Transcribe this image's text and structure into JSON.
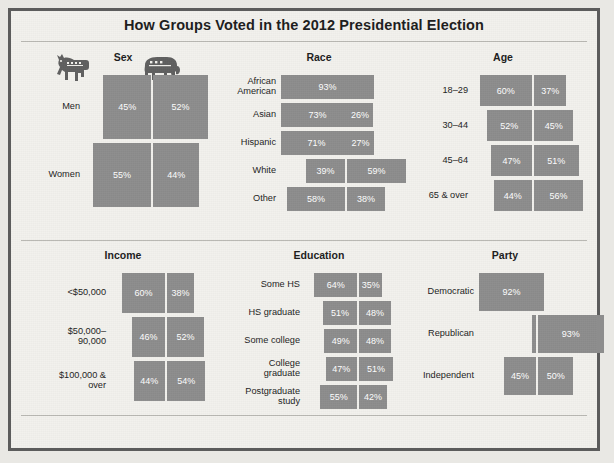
{
  "title": "How Groups Voted in the 2012 Presidential Election",
  "source": "Source: Roper Center, University of Connecticut. \"How Groups Voted in 2012.\" January 10, 2013.",
  "icons": {
    "democrat": "donkey-icon",
    "republican": "elephant-icon"
  },
  "colors": {
    "bar": "#8d8d8d",
    "background": "#f2f1ed",
    "border": "#5c5c5c",
    "text": "#1c1c1c",
    "bar_label": "#ffffff"
  },
  "chart_data": {
    "type": "bar",
    "title": "How Groups Voted in the 2012 Presidential Election",
    "xlabel": "",
    "ylabel": "",
    "grid": false,
    "legend": [
      "Democrat",
      "Republican"
    ],
    "legend_position": "top-icons",
    "units": "percent",
    "series": [
      {
        "name": "Democrat",
        "color": "#8d8d8d"
      },
      {
        "name": "Republican",
        "color": "#8d8d8d"
      }
    ],
    "panels": [
      {
        "name": "Sex",
        "rows": [
          {
            "label": "Men",
            "dem": 45,
            "rep": 52,
            "dem_text": "45%",
            "rep_text": "52%"
          },
          {
            "label": "Women",
            "dem": 55,
            "rep": 44,
            "dem_text": "55%",
            "rep_text": "44%"
          }
        ]
      },
      {
        "name": "Race",
        "rows": [
          {
            "label": "African\nAmerican",
            "dem": 93,
            "rep": 6,
            "dem_text": "93%",
            "rep_text": ""
          },
          {
            "label": "Asian",
            "dem": 73,
            "rep": 26,
            "dem_text": "73%",
            "rep_text": "26%"
          },
          {
            "label": "Hispanic",
            "dem": 71,
            "rep": 27,
            "dem_text": "71%",
            "rep_text": "27%"
          },
          {
            "label": "White",
            "dem": 39,
            "rep": 59,
            "dem_text": "39%",
            "rep_text": "59%"
          },
          {
            "label": "Other",
            "dem": 58,
            "rep": 38,
            "dem_text": "58%",
            "rep_text": "38%"
          }
        ]
      },
      {
        "name": "Age",
        "rows": [
          {
            "label": "18–29",
            "dem": 60,
            "rep": 37,
            "dem_text": "60%",
            "rep_text": "37%"
          },
          {
            "label": "30–44",
            "dem": 52,
            "rep": 45,
            "dem_text": "52%",
            "rep_text": "45%"
          },
          {
            "label": "45–64",
            "dem": 47,
            "rep": 51,
            "dem_text": "47%",
            "rep_text": "51%"
          },
          {
            "label": "65 & over",
            "dem": 44,
            "rep": 56,
            "dem_text": "44%",
            "rep_text": "56%"
          }
        ]
      },
      {
        "name": "Income",
        "rows": [
          {
            "label": "<$50,000",
            "dem": 60,
            "rep": 38,
            "dem_text": "60%",
            "rep_text": "38%"
          },
          {
            "label": "$50,000–\n90,000",
            "dem": 46,
            "rep": 52,
            "dem_text": "46%",
            "rep_text": "52%"
          },
          {
            "label": "$100,000 &\nover",
            "dem": 44,
            "rep": 54,
            "dem_text": "44%",
            "rep_text": "54%"
          }
        ]
      },
      {
        "name": "Education",
        "rows": [
          {
            "label": "Some HS",
            "dem": 64,
            "rep": 35,
            "dem_text": "64%",
            "rep_text": "35%"
          },
          {
            "label": "HS graduate",
            "dem": 51,
            "rep": 48,
            "dem_text": "51%",
            "rep_text": "48%"
          },
          {
            "label": "Some college",
            "dem": 49,
            "rep": 48,
            "dem_text": "49%",
            "rep_text": "48%"
          },
          {
            "label": "College\ngraduate",
            "dem": 47,
            "rep": 51,
            "dem_text": "47%",
            "rep_text": "51%"
          },
          {
            "label": "Postgraduate\nstudy",
            "dem": 55,
            "rep": 42,
            "dem_text": "55%",
            "rep_text": "42%"
          }
        ]
      },
      {
        "name": "Party",
        "rows": [
          {
            "label": "Democratic",
            "dem": 92,
            "rep": 7,
            "dem_text": "92%",
            "rep_text": ""
          },
          {
            "label": "Republican",
            "dem": 6,
            "rep": 93,
            "dem_text": "",
            "rep_text": "93%"
          },
          {
            "label": "Independent",
            "dem": 45,
            "rep": 50,
            "dem_text": "45%",
            "rep_text": "50%"
          }
        ]
      }
    ]
  }
}
